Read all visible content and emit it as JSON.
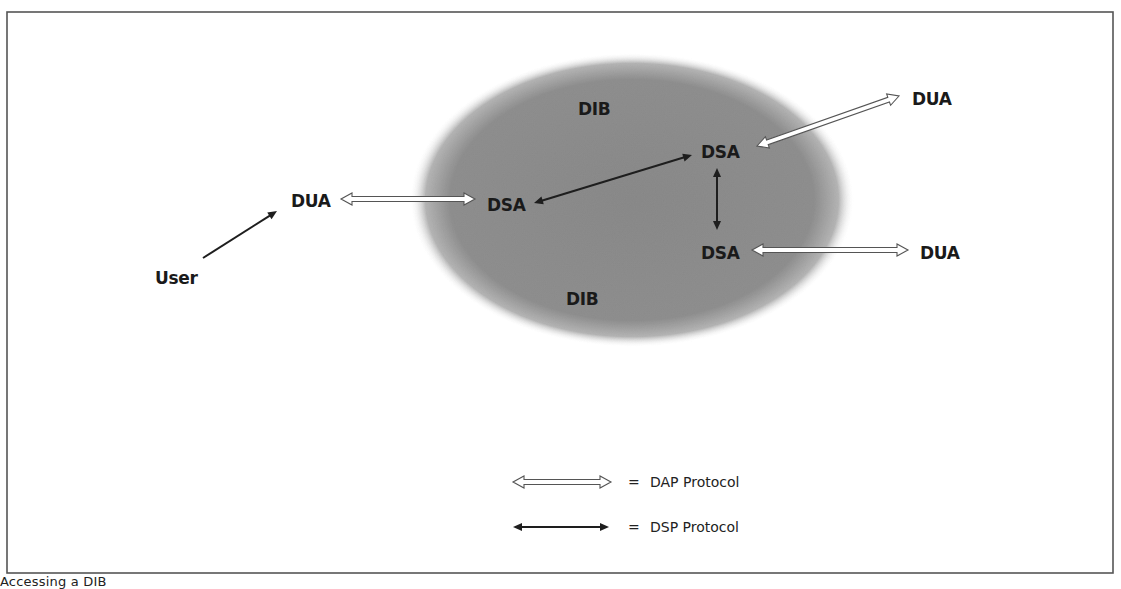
{
  "figure": {
    "caption": "Accessing a DIB",
    "frame": {
      "x": 7,
      "y": 12,
      "width": 1106,
      "height": 561,
      "stroke": "#555555"
    }
  },
  "colors": {
    "ellipse_fill": "#8c8c8c",
    "ellipse_edge": "#ffffff",
    "dsp_arrow": "#1e1e1e",
    "dap_arrow_outline": "#555555",
    "dap_arrow_fill": "#ffffff",
    "text": "#1a1a1a"
  },
  "dib": {
    "ellipse": {
      "cx": 632,
      "cy": 200,
      "rx": 222,
      "ry": 147
    },
    "labels": [
      {
        "text": "DIB",
        "x": 578,
        "y": 115
      },
      {
        "text": "DIB",
        "x": 566,
        "y": 305
      }
    ]
  },
  "nodes": {
    "user": {
      "text": "User",
      "x": 155,
      "y": 284
    },
    "dua_left": {
      "text": "DUA",
      "x": 291,
      "y": 207
    },
    "dsa_left": {
      "text": "DSA",
      "x": 487,
      "y": 211
    },
    "dsa_top": {
      "text": "DSA",
      "x": 701,
      "y": 158
    },
    "dsa_bottom": {
      "text": "DSA",
      "x": 701,
      "y": 259
    },
    "dua_top_right": {
      "text": "DUA",
      "x": 912,
      "y": 105
    },
    "dua_bottom_right": {
      "text": "DUA",
      "x": 920,
      "y": 259
    }
  },
  "connections": {
    "user_to_dua": {
      "type": "plain",
      "x1": 203,
      "y1": 258,
      "x2": 277,
      "y2": 211
    },
    "dua_left_dsa_left": {
      "type": "DAP",
      "x1": 341,
      "y1": 199,
      "x2": 475,
      "y2": 199
    },
    "dsa_left_dsa_top": {
      "type": "DSP",
      "x1": 534,
      "y1": 203,
      "x2": 692,
      "y2": 155
    },
    "dsa_top_dsa_bottom": {
      "type": "DSP",
      "x1": 717,
      "y1": 168,
      "x2": 717,
      "y2": 230
    },
    "dsa_top_dua_top_right": {
      "type": "DAP",
      "x1": 757,
      "y1": 146,
      "x2": 899,
      "y2": 96
    },
    "dsa_bottom_dua_bottom_right": {
      "type": "DAP",
      "x1": 752,
      "y1": 250,
      "x2": 908,
      "y2": 250
    }
  },
  "legend": {
    "items": [
      {
        "type": "DAP",
        "symbol": "=",
        "label": "DAP Protocol",
        "x1": 513,
        "x2": 611,
        "y": 482,
        "text_x": 628
      },
      {
        "type": "DSP",
        "symbol": "=",
        "label": "DSP Protocol",
        "x1": 513,
        "x2": 609,
        "y": 527,
        "text_x": 628
      }
    ]
  }
}
